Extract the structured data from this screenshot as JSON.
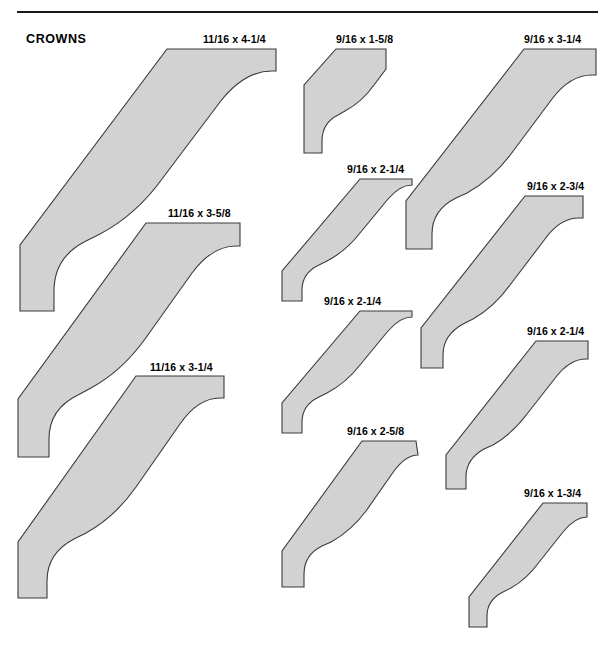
{
  "page": {
    "section_title": "CROWNS",
    "width": 615,
    "height": 662,
    "background_color": "#ffffff",
    "rule_color": "#1a1a1a",
    "profile_fill_color": "#d2d2d2",
    "profile_stroke_color": "#3b3b3b"
  },
  "profiles": [
    {
      "id": "crown-11-16-x-4-1-4",
      "label": "11/16 x 4-1/4",
      "thickness": "11/16",
      "width": "4-1/4",
      "column": 1,
      "label_x": 203,
      "label_y": 33,
      "shape_x": 14,
      "shape_y": 45,
      "shape_w": 270,
      "shape_h": 308,
      "path": "M 255,4 L 153,4 L 6,200 L 6,266 L 40,266 L 40,246 Q 40,212 72,196 L 86,189 Q 122,170 148,134 L 206,57 Q 230,26 258,26 L 262,26 L 262,4 Z"
    },
    {
      "id": "crown-11-16-x-3-5-8",
      "label": "11/16 x 3-5/8",
      "thickness": "11/16",
      "width": "3-5/8",
      "column": 1,
      "label_x": 168,
      "label_y": 207,
      "shape_x": 12,
      "shape_y": 219,
      "shape_w": 252,
      "shape_h": 280,
      "path": "M 221,4 L 134,4 L 6,180 L 6,238 L 37,238 L 37,220 Q 37,190 66,176 L 79,169 Q 110,152 133,120 L 180,54 Q 200,27 224,27 L 228,27 L 228,4 Z"
    },
    {
      "id": "crown-11-16-x-3-1-4",
      "label": "11/16 x 3-1/4",
      "thickness": "11/16",
      "width": "3-1/4",
      "column": 1,
      "label_x": 150,
      "label_y": 361,
      "shape_x": 12,
      "shape_y": 372,
      "shape_w": 242,
      "shape_h": 268,
      "path": "M 206,4 L 124,4 L 6,170 L 6,226 L 35,226 L 35,209 Q 35,181 62,167 L 74,161 Q 103,145 124,115 L 168,52 Q 186,26 208,26 L 212,26 L 212,4 Z"
    },
    {
      "id": "crown-9-16-x-1-5-8",
      "label": "9/16 x 1-5/8",
      "thickness": "9/16",
      "width": "1-5/8",
      "column": 2,
      "label_x": 336,
      "label_y": 33,
      "shape_x": 300,
      "shape_y": 45,
      "shape_w": 92,
      "shape_h": 120,
      "path": "M 86,4 L 36,4 L 4,40 L 4,108 L 22,108 L 22,96 Q 22,78 38,70 L 45,66 Q 62,57 74,40 L 86,24 Z"
    },
    {
      "id": "crown-9-16-x-2-1-4-upper",
      "label": "9/16 x 2-1/4",
      "thickness": "9/16",
      "width": "2-1/4",
      "column": 2,
      "label_x": 347,
      "label_y": 163,
      "shape_x": 276,
      "shape_y": 175,
      "shape_w": 140,
      "shape_h": 135,
      "path": "M 136,4 L 84,4 L 6,96 L 6,126 L 26,126 L 26,115 Q 26,98 43,90 L 51,86 Q 70,76 84,58 L 112,24 Q 124,10 136,10 Z"
    },
    {
      "id": "crown-9-16-x-2-1-4-middle",
      "label": "9/16 x 2-1/4",
      "thickness": "9/16",
      "width": "2-1/4",
      "column": 2,
      "label_x": 324,
      "label_y": 295,
      "shape_x": 276,
      "shape_y": 307,
      "shape_w": 140,
      "shape_h": 135,
      "path": "M 136,4 L 84,4 L 6,96 L 6,126 L 26,126 L 26,115 Q 26,98 43,90 L 51,86 Q 70,76 84,58 L 112,24 Q 124,10 136,10 Z"
    },
    {
      "id": "crown-9-16-x-2-5-8",
      "label": "9/16 x 2-5/8",
      "thickness": "9/16",
      "width": "2-5/8",
      "column": 2,
      "label_x": 347,
      "label_y": 425,
      "shape_x": 276,
      "shape_y": 437,
      "shape_w": 150,
      "shape_h": 160,
      "path": "M 140,4 L 86,4 L 6,114 L 6,150 L 28,150 L 28,137 Q 28,118 46,109 L 55,105 Q 75,94 90,74 L 118,34 Q 130,18 142,18 Z"
    },
    {
      "id": "crown-9-16-x-3-1-4",
      "label": "9/16 x 3-1/4",
      "thickness": "9/16",
      "width": "3-1/4",
      "column": 3,
      "label_x": 524,
      "label_y": 33,
      "shape_x": 400,
      "shape_y": 45,
      "shape_w": 205,
      "shape_h": 245,
      "path": "M 196,4 L 124,4 L 6,156 L 6,204 L 32,204 L 32,189 Q 32,165 56,153 L 67,148 Q 92,134 111,109 L 152,54 Q 170,30 192,30 L 196,30 Z"
    },
    {
      "id": "crown-9-16-x-2-3-4",
      "label": "9/16 x 2-3/4",
      "thickness": "9/16",
      "width": "2-3/4",
      "column": 3,
      "label_x": 527,
      "label_y": 180,
      "shape_x": 415,
      "shape_y": 192,
      "shape_w": 180,
      "shape_h": 205,
      "path": "M 168,4 L 110,4 L 6,136 L 6,176 L 28,176 L 28,163 Q 28,143 48,132 L 58,127 Q 79,115 95,93 L 130,47 Q 145,26 164,26 L 168,26 Z"
    },
    {
      "id": "crown-9-16-x-2-1-4-lower",
      "label": "9/16 x 2-1/4",
      "thickness": "9/16",
      "width": "2-1/4",
      "column": 3,
      "label_x": 527,
      "label_y": 325,
      "shape_x": 440,
      "shape_y": 337,
      "shape_w": 155,
      "shape_h": 175,
      "path": "M 148,4 L 96,4 L 6,118 L 6,152 L 26,152 L 26,140 Q 26,122 44,112 L 53,108 Q 72,97 87,77 L 116,40 Q 130,22 146,22 L 148,22 Z"
    },
    {
      "id": "crown-9-16-x-1-3-4",
      "label": "9/16 x 1-3/4",
      "thickness": "9/16",
      "width": "1-3/4",
      "column": 3,
      "label_x": 524,
      "label_y": 487,
      "shape_x": 463,
      "shape_y": 499,
      "shape_w": 132,
      "shape_h": 150,
      "path": "M 124,4 L 80,4 L 6,98 L 6,128 L 24,128 L 24,117 Q 24,101 40,93 L 48,89 Q 64,80 77,62 L 100,33 Q 112,18 124,18 Z"
    }
  ]
}
